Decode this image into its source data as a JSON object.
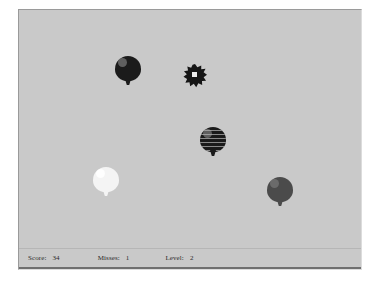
{
  "window": {
    "name": "balloon-game-window",
    "background_color": "#c9c9c9",
    "border_color": "#9a9a9a"
  },
  "play_field": {
    "background_color": "#c9c9c9",
    "sprites": [
      {
        "kind": "balloon",
        "name": "balloon-dark-top-left",
        "style": "dark",
        "color": "#1b1b1b",
        "x": 96,
        "y": 46,
        "width": 26,
        "height": 30
      },
      {
        "kind": "pop",
        "name": "balloon-pop-burst",
        "color": "#151515",
        "core_color": "#eaeaea",
        "x": 164,
        "y": 54,
        "width": 24,
        "height": 24
      },
      {
        "kind": "balloon",
        "name": "balloon-striped-center",
        "style": "striped",
        "color": "#1b1b1b",
        "x": 181,
        "y": 117,
        "width": 26,
        "height": 30
      },
      {
        "kind": "balloon",
        "name": "balloon-white-left",
        "style": "light",
        "color": "#f4f4f4",
        "x": 74,
        "y": 157,
        "width": 26,
        "height": 30
      },
      {
        "kind": "balloon",
        "name": "balloon-gray-bottom-right",
        "style": "gray",
        "color": "#4b4b4b",
        "x": 248,
        "y": 167,
        "width": 26,
        "height": 30
      }
    ]
  },
  "status_bar": {
    "score": {
      "label": "Score:",
      "value": "34"
    },
    "misses": {
      "label": "Misses:",
      "value": "1"
    },
    "level": {
      "label": "Level:",
      "value": "2"
    }
  }
}
